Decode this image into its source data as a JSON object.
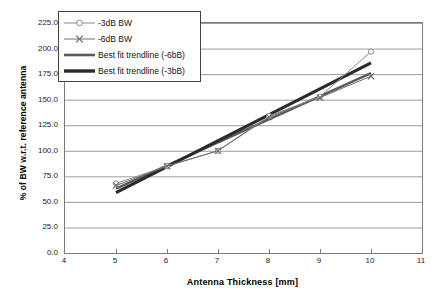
{
  "chart_data": {
    "type": "line",
    "title": "",
    "xlabel": "Antenna Thickness  [mm]",
    "ylabel": "% of BW w.r.t. reference antenna",
    "xlim": [
      4,
      11
    ],
    "ylim": [
      0,
      225
    ],
    "xticks": [
      "4",
      "5",
      "6",
      "7",
      "8",
      "9",
      "10",
      "11"
    ],
    "yticks": [
      "0.0",
      "25.0",
      "50.0",
      "75.0",
      "100.0",
      "125.0",
      "150.0",
      "175.0",
      "200.0",
      "225.0"
    ],
    "xtick_values": [
      4,
      5,
      6,
      7,
      8,
      9,
      10,
      11
    ],
    "ytick_values": [
      0,
      25,
      50,
      75,
      100,
      125,
      150,
      175,
      200,
      225
    ],
    "grid": "horizontal",
    "legend_position": "top-left",
    "x": [
      5,
      6,
      7,
      8,
      9,
      10
    ],
    "series": [
      {
        "name": "-3dB BW",
        "marker": "open-circle",
        "style": "thin-line",
        "color": "#8a8a8a",
        "values": [
          68,
          85,
          100,
          134,
          153,
          197
        ]
      },
      {
        "name": "-6dB BW",
        "marker": "cross",
        "style": "thin-line",
        "color": "#6e6e6e",
        "values": [
          66,
          85,
          100,
          133,
          152,
          173
        ]
      },
      {
        "name": "Best fit trendline (-6bB)",
        "marker": "none",
        "style": "thick-line",
        "color": "#5a5a5a",
        "endpoints": [
          [
            5,
            63
          ],
          [
            10,
            176
          ]
        ]
      },
      {
        "name": "Best fit trendline (-3bB)",
        "marker": "none",
        "style": "thick-line",
        "color": "#2b2b2b",
        "endpoints": [
          [
            5,
            59
          ],
          [
            10,
            186
          ]
        ]
      }
    ],
    "legend": [
      {
        "label": "-3dB BW",
        "marker": "open-circle",
        "color": "#8a8a8a",
        "width": 1
      },
      {
        "label": "-6dB BW",
        "marker": "cross",
        "color": "#6e6e6e",
        "width": 1
      },
      {
        "label": "Best fit trendline (-6bB)",
        "marker": "none",
        "color": "#5a5a5a",
        "width": 2.6
      },
      {
        "label": "Best fit trendline (-3bB)",
        "marker": "none",
        "color": "#2b2b2b",
        "width": 3.4
      }
    ],
    "colors": {
      "frame": "#7a7a7a",
      "grid": "#9d9d9d",
      "text": "#111111",
      "background": "#ffffff"
    }
  }
}
